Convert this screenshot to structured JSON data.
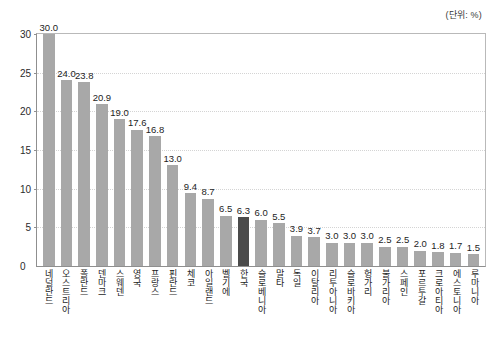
{
  "unit_note": "(단위: %)",
  "zero_label": "0",
  "colors": {
    "bar_default": "#a8a8a8",
    "bar_highlight": "#4b4b4b",
    "gridline": "#d4d4d4",
    "axis": "#8f8f8f"
  },
  "chart_data": {
    "type": "bar",
    "title": "",
    "subtitle": "",
    "xlabel": "",
    "ylabel": "",
    "unit": "%",
    "ylim": [
      0,
      30
    ],
    "yticks": [
      0,
      5,
      10,
      15,
      20,
      25,
      30
    ],
    "ytick_labels": [
      "0",
      "5",
      "10",
      "15",
      "20",
      "25",
      "30"
    ],
    "grid": true,
    "legend": "none",
    "highlight_category": "한국",
    "categories": [
      "네덜란드",
      "오스트리아",
      "폴란드",
      "덴마크",
      "스웨덴",
      "영국",
      "프랑스",
      "핀란드",
      "체코",
      "아일랜드",
      "벨기에",
      "한국",
      "슬로베니아",
      "말타",
      "독일",
      "이탈리아",
      "리투아니아",
      "슬로바키아",
      "헝가리",
      "불가리아",
      "스페인",
      "포르투갈",
      "크로아티아",
      "에스토니아",
      "루마니아"
    ],
    "values": [
      30.0,
      24.0,
      23.8,
      20.9,
      19.0,
      17.6,
      16.8,
      13.0,
      9.4,
      8.7,
      6.5,
      6.3,
      6.0,
      5.5,
      3.9,
      3.7,
      3.0,
      3.0,
      3.0,
      2.5,
      2.5,
      2.0,
      1.8,
      1.7,
      1.5
    ],
    "value_labels": [
      "30.0",
      "24.0",
      "23.8",
      "20.9",
      "19.0",
      "17.6",
      "16.8",
      "13.0",
      "9.4",
      "8.7",
      "6.5",
      "6.3",
      "6.0",
      "5.5",
      "3.9",
      "3.7",
      "3.0",
      "3.0",
      "3.0",
      "2.5",
      "2.5",
      "2.0",
      "1.8",
      "1.7",
      "1.5"
    ]
  }
}
